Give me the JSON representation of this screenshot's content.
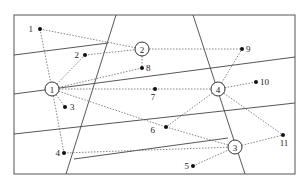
{
  "diagram": {
    "frame": {
      "x": 14,
      "y": 15,
      "width": 281,
      "height": 159
    },
    "solid_lines": [
      {
        "x1": 116,
        "y1": 15,
        "x2": 66,
        "y2": 174
      },
      {
        "x1": 193,
        "y1": 15,
        "x2": 245,
        "y2": 174
      },
      {
        "x1": 14,
        "y1": 55,
        "x2": 108,
        "y2": 43
      },
      {
        "x1": 14,
        "y1": 94,
        "x2": 295,
        "y2": 57
      },
      {
        "x1": 14,
        "y1": 134,
        "x2": 295,
        "y2": 103
      },
      {
        "x1": 74,
        "y1": 159,
        "x2": 228,
        "y2": 138
      }
    ],
    "hubs": [
      {
        "id": "1",
        "label": "1",
        "x": 52,
        "y": 89
      },
      {
        "id": "2",
        "label": "2",
        "x": 142,
        "y": 49
      },
      {
        "id": "3",
        "label": "3",
        "x": 235,
        "y": 147
      },
      {
        "id": "4",
        "label": "4",
        "x": 218,
        "y": 89
      }
    ],
    "points": [
      {
        "label": "1",
        "x": 40,
        "y": 29,
        "lx": 33,
        "ly": 32,
        "anchor": "end"
      },
      {
        "label": "2",
        "x": 85,
        "y": 55,
        "lx": 79,
        "ly": 58,
        "anchor": "end"
      },
      {
        "label": "3",
        "x": 65,
        "y": 107,
        "lx": 70,
        "ly": 110,
        "anchor": "start"
      },
      {
        "label": "4",
        "x": 64,
        "y": 153,
        "lx": 60,
        "ly": 156,
        "anchor": "end"
      },
      {
        "label": "5",
        "x": 193,
        "y": 166,
        "lx": 189,
        "ly": 169,
        "anchor": "end"
      },
      {
        "label": "6",
        "x": 166,
        "y": 127,
        "lx": 155,
        "ly": 133,
        "anchor": "end"
      },
      {
        "label": "7",
        "x": 155,
        "y": 89,
        "lx": 153,
        "ly": 100,
        "anchor": "middle"
      },
      {
        "label": "8",
        "x": 142,
        "y": 68,
        "lx": 146,
        "ly": 71,
        "anchor": "start"
      },
      {
        "label": "9",
        "x": 242,
        "y": 49,
        "lx": 246,
        "ly": 52,
        "anchor": "start"
      },
      {
        "label": "10",
        "x": 256,
        "y": 82,
        "lx": 260,
        "ly": 85,
        "anchor": "start"
      },
      {
        "label": "11",
        "x": 283,
        "y": 135,
        "lx": 284,
        "ly": 146,
        "anchor": "middle"
      }
    ],
    "edges": [
      {
        "from": "p1",
        "to": "h2"
      },
      {
        "from": "p1",
        "to": "h1"
      },
      {
        "from": "p2",
        "to": "h2"
      },
      {
        "from": "p2",
        "to": "h1"
      },
      {
        "from": "h2",
        "to": "p8"
      },
      {
        "from": "h2",
        "to": "p9"
      },
      {
        "from": "h1",
        "to": "p8"
      },
      {
        "from": "h1",
        "to": "p7"
      },
      {
        "from": "h1",
        "to": "p3"
      },
      {
        "from": "h1",
        "to": "p4"
      },
      {
        "from": "h1",
        "to": "p6"
      },
      {
        "from": "p7",
        "to": "h4"
      },
      {
        "from": "h4",
        "to": "p9"
      },
      {
        "from": "h4",
        "to": "p10"
      },
      {
        "from": "h4",
        "to": "p6"
      },
      {
        "from": "h4",
        "to": "p11"
      },
      {
        "from": "p6",
        "to": "h3"
      },
      {
        "from": "p4",
        "to": "h3"
      },
      {
        "from": "p5",
        "to": "h3"
      },
      {
        "from": "h3",
        "to": "p11"
      }
    ]
  }
}
